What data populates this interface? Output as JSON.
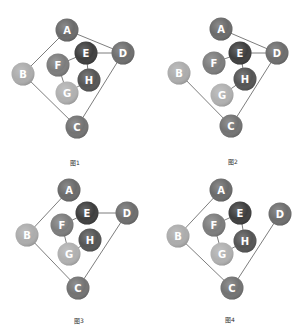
{
  "node_colors": {
    "A": "#6a6a6a",
    "B": "#acacac",
    "C": "#727272",
    "D": "#6d6d6d",
    "E": "#3d3d3d",
    "F": "#7c7c7c",
    "G": "#b0b0b0",
    "H": "#545454"
  },
  "node_radius": 11.5,
  "diagrams": [
    {
      "caption": "图1",
      "caption_pos": [
        75,
        163
      ],
      "nodes": {
        "A": [
          67,
          30
        ],
        "B": [
          23,
          74
        ],
        "C": [
          77,
          127
        ],
        "D": [
          123,
          53
        ],
        "E": [
          86,
          53
        ],
        "F": [
          58,
          65
        ],
        "G": [
          67,
          93
        ],
        "H": [
          89,
          80
        ]
      },
      "edges": [
        [
          "A",
          "B"
        ],
        [
          "A",
          "D"
        ],
        [
          "E",
          "D"
        ],
        [
          "E",
          "F"
        ],
        [
          "E",
          "H"
        ],
        [
          "F",
          "G"
        ],
        [
          "G",
          "H"
        ],
        [
          "B",
          "C"
        ],
        [
          "C",
          "D"
        ]
      ]
    },
    {
      "caption": "图2",
      "caption_pos": [
        233,
        162
      ],
      "nodes": {
        "A": [
          221,
          29
        ],
        "B": [
          179,
          73
        ],
        "C": [
          231,
          126
        ],
        "D": [
          277,
          53
        ],
        "E": [
          240,
          53
        ],
        "F": [
          214,
          63
        ],
        "G": [
          222,
          95
        ],
        "H": [
          245,
          79
        ]
      },
      "edges": [
        [
          "A",
          "D"
        ],
        [
          "E",
          "D"
        ],
        [
          "E",
          "F"
        ],
        [
          "E",
          "H"
        ],
        [
          "G",
          "H"
        ],
        [
          "B",
          "C"
        ],
        [
          "C",
          "D"
        ]
      ]
    },
    {
      "caption": "图3",
      "caption_pos": [
        79,
        321
      ],
      "nodes": {
        "A": [
          69,
          190
        ],
        "B": [
          27,
          235
        ],
        "C": [
          78,
          288
        ],
        "D": [
          127,
          213
        ],
        "E": [
          87,
          213
        ],
        "F": [
          62,
          225
        ],
        "G": [
          69,
          254
        ],
        "H": [
          90,
          240
        ]
      },
      "edges": [
        [
          "A",
          "B"
        ],
        [
          "E",
          "D"
        ],
        [
          "E",
          "F"
        ],
        [
          "F",
          "G"
        ],
        [
          "G",
          "H"
        ],
        [
          "B",
          "C"
        ],
        [
          "C",
          "D"
        ]
      ]
    },
    {
      "caption": "图4",
      "caption_pos": [
        230,
        320
      ],
      "nodes": {
        "A": [
          221,
          190
        ],
        "B": [
          178,
          236
        ],
        "C": [
          232,
          288
        ],
        "D": [
          280,
          214
        ],
        "E": [
          240,
          213
        ],
        "F": [
          214,
          225
        ],
        "G": [
          222,
          254
        ],
        "H": [
          245,
          241
        ]
      },
      "edges": [
        [
          "A",
          "B"
        ],
        [
          "E",
          "F"
        ],
        [
          "E",
          "H"
        ],
        [
          "F",
          "G"
        ],
        [
          "G",
          "H"
        ],
        [
          "B",
          "C"
        ],
        [
          "C",
          "D"
        ]
      ]
    }
  ]
}
